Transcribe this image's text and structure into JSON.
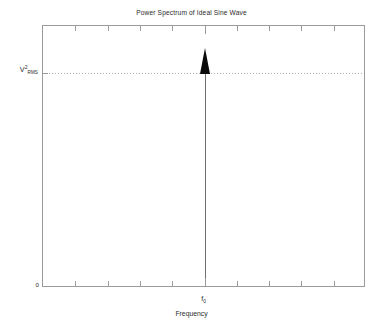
{
  "chart_data": {
    "type": "line",
    "title": "Power Spectrum of Ideal Sine Wave",
    "xlabel": "Frequency",
    "ylabel": "V²RMS",
    "ylabel_parts": {
      "base": "V",
      "superscript": "2",
      "subscript": "RMS"
    },
    "grid": false,
    "legend": null,
    "xlim": [
      0,
      10
    ],
    "ylim": [
      0,
      1.22
    ],
    "x_tick_labels": [
      "f₀"
    ],
    "y_tick_labels": [
      "0",
      "V²RMS"
    ],
    "x_tick_values": [
      1,
      2,
      3,
      4,
      5,
      6,
      7,
      8,
      9
    ],
    "y_tick_values": [
      0,
      1
    ],
    "x": [
      5
    ],
    "values": [
      1
    ],
    "series": [
      {
        "name": "Ideal sine wave spectral line",
        "type": "impulse",
        "x": [
          5
        ],
        "values": [
          1
        ]
      }
    ],
    "annotations": [
      {
        "name": "rms-reference-level",
        "type": "horizontal-dotted-line",
        "y": 1,
        "label": "V²RMS"
      },
      {
        "name": "fundamental-frequency-marker",
        "type": "arrow-impulse",
        "x": 5,
        "label": "f₀"
      }
    ],
    "colors": {
      "frame": "#9a9a9a",
      "impulse_stem": "#6f6f6f",
      "arrowhead": "#0a0a0a",
      "dotted_line": "#b0b0b0",
      "text": "#2b2b2b",
      "background": "#ffffff"
    }
  },
  "labels": {
    "f0": "f",
    "f0_sub": "0",
    "zero": "0",
    "rms_base": "V",
    "rms_sup": "2",
    "rms_sub": "RMS"
  }
}
